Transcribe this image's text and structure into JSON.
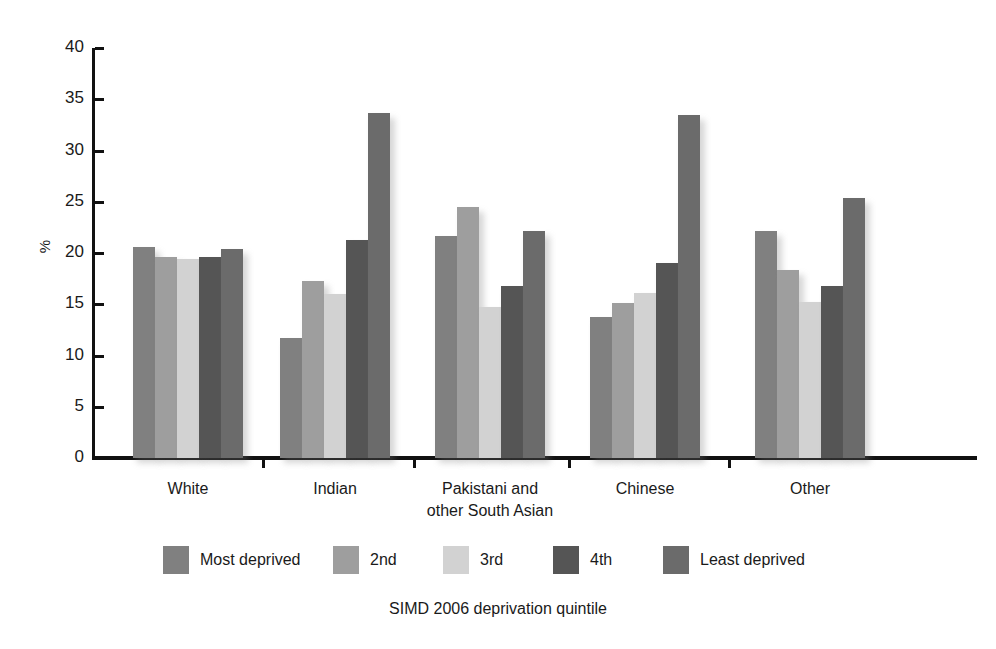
{
  "chart_data": {
    "type": "bar",
    "title": "",
    "subtitle": "",
    "xlabel": "SIMD 2006 deprivation quintile",
    "ylabel": "%",
    "ylim": [
      0,
      40
    ],
    "ytick_step": 5,
    "yticks": [
      "40",
      "35",
      "30",
      "25",
      "20",
      "15",
      "10",
      "5",
      "0"
    ],
    "grid": false,
    "legend_position": "bottom",
    "categories": [
      "White",
      "Indian",
      "Pakistani and\nother South Asian",
      "Chinese",
      "Other"
    ],
    "category_labels": [
      {
        "line1": "White",
        "line2": ""
      },
      {
        "line1": "Indian",
        "line2": ""
      },
      {
        "line1": "Pakistani and",
        "line2": "other South Asian"
      },
      {
        "line1": "Chinese",
        "line2": ""
      },
      {
        "line1": "Other",
        "line2": ""
      }
    ],
    "series": [
      {
        "name": "Most deprived",
        "color": "#808080",
        "values": [
          20.6,
          11.7,
          21.7,
          13.8,
          22.1
        ]
      },
      {
        "name": "2nd",
        "color": "#9e9e9e",
        "values": [
          19.6,
          17.3,
          24.5,
          15.1,
          18.3
        ]
      },
      {
        "name": "3rd",
        "color": "#d2d2d2",
        "values": [
          19.4,
          16.0,
          14.7,
          16.1,
          15.2
        ]
      },
      {
        "name": "4th",
        "color": "#555555",
        "values": [
          19.6,
          21.3,
          16.8,
          19.0,
          16.8
        ]
      },
      {
        "name": "Least deprived",
        "color": "#6b6b6b",
        "values": [
          20.4,
          33.7,
          22.1,
          33.5,
          25.4
        ]
      }
    ]
  },
  "legend": {
    "items": [
      {
        "label": "Most deprived"
      },
      {
        "label": "2nd"
      },
      {
        "label": "3rd"
      },
      {
        "label": "4th"
      },
      {
        "label": "Least deprived"
      }
    ]
  },
  "axes": {
    "y_title": "%",
    "x_title": "SIMD 2006 deprivation quintile"
  }
}
